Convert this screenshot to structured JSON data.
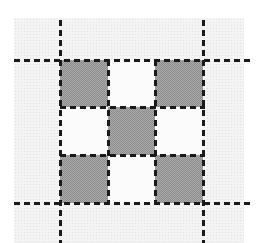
{
  "figure": {
    "type": "grid-pattern",
    "grid": {
      "rows": 3,
      "cols": 3,
      "cells": [
        [
          {
            "shaded": true
          },
          {
            "shaded": false
          },
          {
            "shaded": true
          }
        ],
        [
          {
            "shaded": false
          },
          {
            "shaded": true
          },
          {
            "shaded": false
          }
        ],
        [
          {
            "shaded": true
          },
          {
            "shaded": false
          },
          {
            "shaded": true
          }
        ]
      ]
    },
    "colors": {
      "shade": "#a9a9a9",
      "line": "#1a1a1a",
      "background": "#f4f4f4"
    }
  }
}
